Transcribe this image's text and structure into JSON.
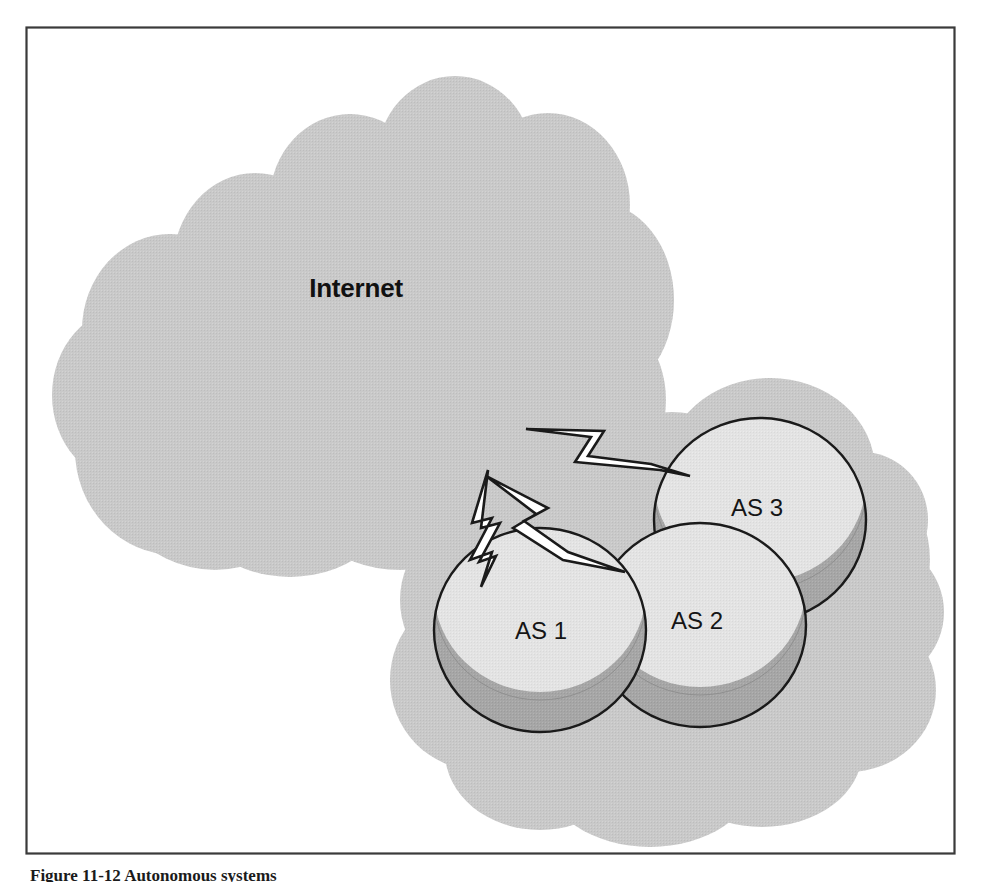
{
  "figure": {
    "caption": "Figure 11-12    Autonomous systems",
    "frame": {
      "x": 26,
      "y": 27,
      "width": 928,
      "height": 826,
      "border_color": "#3a3a3a"
    },
    "background_color": "#ffffff"
  },
  "colors": {
    "cloud_fill": "#c9c9c9",
    "cylinder_top": "#e3e3e3",
    "cylinder_band": "#a6a6a6",
    "outline": "#1a1a1a",
    "bolt_fill": "#ffffff",
    "text": "#141414"
  },
  "clouds": [
    {
      "name": "internet-cloud",
      "label": "Internet",
      "label_x": 356,
      "label_y": 297
    },
    {
      "name": "as-group-cloud",
      "label": "",
      "label_x": 0,
      "label_y": 0
    }
  ],
  "nodes": [
    {
      "name": "as-1",
      "label": "AS 1",
      "cx": 540,
      "cy": 630,
      "rx": 106,
      "ry": 102,
      "label_x": 541,
      "label_y": 639
    },
    {
      "name": "as-2",
      "label": "AS 2",
      "cx": 700,
      "cy": 625,
      "rx": 106,
      "ry": 102,
      "label_x": 697,
      "label_y": 629
    },
    {
      "name": "as-3",
      "label": "AS 3",
      "cx": 760,
      "cy": 520,
      "rx": 106,
      "ry": 102,
      "label_x": 757,
      "label_y": 516
    }
  ],
  "links": [
    {
      "name": "link-internet-as1",
      "from": "internet-cloud",
      "to": "as-1",
      "style": "lightning-bolt"
    },
    {
      "name": "link-internet-as2",
      "from": "internet-cloud",
      "to": "as-2",
      "style": "lightning-bolt"
    },
    {
      "name": "link-internet-as3",
      "from": "internet-cloud",
      "to": "as-3",
      "style": "lightning-bolt"
    }
  ]
}
